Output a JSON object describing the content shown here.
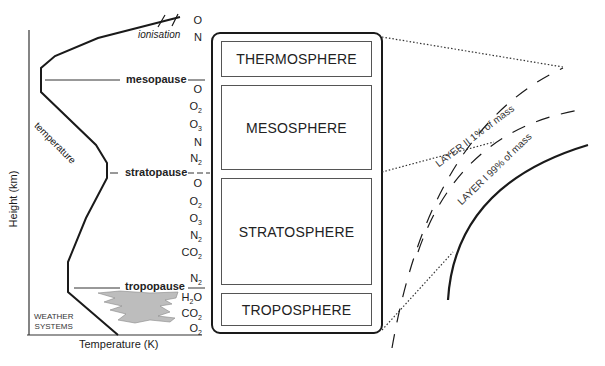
{
  "axes": {
    "y_label": "Height (km)",
    "x_label": "Temperature (K)"
  },
  "curve": {
    "temperature_label": "temperature",
    "ionisation_label": "ionisation"
  },
  "boundaries": {
    "mesopause": "mesopause",
    "stratopause": "stratopause",
    "tropopause": "tropopause"
  },
  "weather": {
    "line1": "WEATHER",
    "line2": "SYSTEMS"
  },
  "layers": [
    {
      "name": "THERMOSPHERE"
    },
    {
      "name": "MESOSPHERE"
    },
    {
      "name": "STRATOSPHERE"
    },
    {
      "name": "TROPOSPHERE"
    }
  ],
  "chemicals": {
    "thermosphere": [
      "O",
      "N"
    ],
    "mesosphere": [
      "O",
      "O2",
      "O3",
      "N",
      "N2"
    ],
    "stratosphere": [
      "O",
      "O2",
      "O3",
      "N2",
      "CO2",
      "N2"
    ],
    "troposphere": [
      "H2O",
      "CO2",
      "O2"
    ]
  },
  "mass_layers": {
    "layer2": "LAYER II  1% of mass",
    "layer1": "LAYER I  99% of mass"
  },
  "colors": {
    "line": "#1a1a1a",
    "cloud": "#bdbdbd",
    "box_border": "#555555"
  }
}
